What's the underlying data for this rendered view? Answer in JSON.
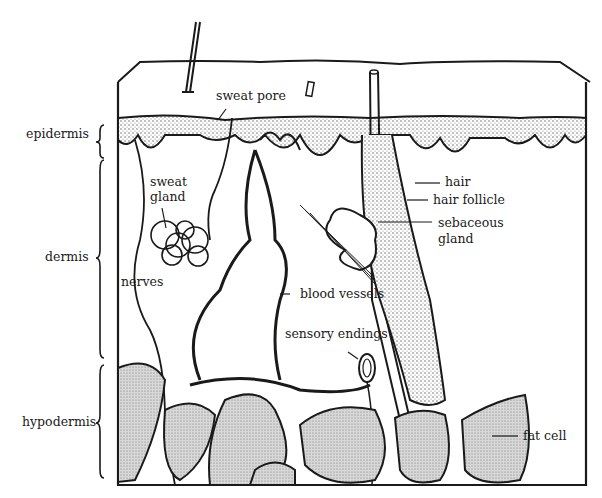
{
  "colors": {
    "ink": "#1a1a1a",
    "paper": "#ffffff",
    "stipple": "#9a9a9a"
  },
  "layers": [
    {
      "name": "epidermis"
    },
    {
      "name": "dermis"
    },
    {
      "name": "hypodermis"
    }
  ],
  "labels": {
    "sweat_pore": "sweat pore",
    "sweat_gland_1": "sweat",
    "sweat_gland_2": "gland",
    "nerves": "nerves",
    "blood_vessels": "blood vessels",
    "sensory_endings": "sensory endings",
    "hair": "hair",
    "hair_follicle": "hair follicle",
    "sebaceous_1": "sebaceous",
    "sebaceous_2": "gland",
    "fat_cell": "fat cell"
  }
}
